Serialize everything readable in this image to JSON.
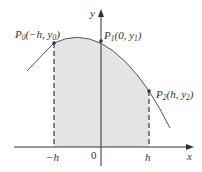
{
  "diagram": {
    "type": "simpson-rule-parabola",
    "axes": {
      "x_label": "x",
      "y_label": "y",
      "origin_label": "0"
    },
    "x_ticks": [
      {
        "label": "−h",
        "x": -1
      },
      {
        "label": "h",
        "x": 1
      }
    ],
    "points": [
      {
        "name": "P",
        "sub": "0",
        "coords": "(−h, y",
        "coord_sub": "0",
        "close": ")"
      },
      {
        "name": "P",
        "sub": "1",
        "coords": "(0, y",
        "coord_sub": "1",
        "close": ")"
      },
      {
        "name": "P",
        "sub": "2",
        "coords": "(h, y",
        "coord_sub": "2",
        "close": ")"
      }
    ],
    "colors": {
      "curve": "#555555",
      "fill": "#e4e4e4",
      "axis": "#333333",
      "dash": "#444444",
      "point": "#333333"
    }
  }
}
